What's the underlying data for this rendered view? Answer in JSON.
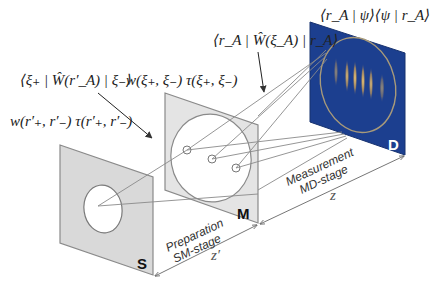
{
  "panels": {
    "source": {
      "label": "S",
      "fill": "#d9d9d9",
      "stroke": "#8a8a8a"
    },
    "mask": {
      "label": "M",
      "fill": "#e4e4e4",
      "stroke": "#8a8a8a"
    },
    "detector": {
      "label": "D",
      "fill": "#1c3f8f",
      "stroke": "#17326f",
      "label_color": "#ffffff"
    }
  },
  "formulas": {
    "source_function": "w(r′₊, r′₋) τ(r′₊, r′₋)",
    "mask_wigner": "⟨ξ₊ | Ŵ(r′_A) | ξ₋⟩",
    "mask_function": "w(ξ₊, ξ₋) τ(ξ₊, ξ₋)",
    "detector_wigner": "⟨r_A | Ŵ(ξ_A) | r_A⟩",
    "detector_intensity": "⟨r_A | ψ⟩⟨ψ | r_A⟩"
  },
  "stages": {
    "preparation": {
      "line1": "Preparation",
      "line2": "SM-stage",
      "distance": "z′"
    },
    "measurement": {
      "line1": "Measurement",
      "line2": "MD-stage",
      "distance": "z"
    }
  },
  "fringes": {
    "count": 7,
    "color": "#f2c65a"
  }
}
